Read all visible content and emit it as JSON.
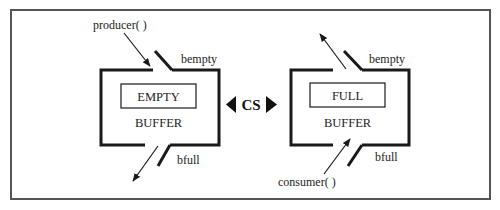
{
  "diagram": {
    "left_buffer": {
      "state_label": "EMPTY",
      "name_label": "BUFFER",
      "top_gate_label": "bempty",
      "bottom_gate_label": "bfull",
      "actor_label": "producer( )",
      "actor_position": "top-left, arrow entering through top gate",
      "exit_arrow": "down-left through bottom gate"
    },
    "center": {
      "label": "CS",
      "left_arrow": "left-pointing triangle",
      "right_arrow": "right-pointing triangle"
    },
    "right_buffer": {
      "state_label": "FULL",
      "name_label": "BUFFER",
      "top_gate_label": "bempty",
      "bottom_gate_label": "bfull",
      "actor_label": "consumer( )",
      "actor_position": "bottom-left, arrow entering through bottom gate",
      "exit_arrow": "up-left through top gate"
    },
    "colors": {
      "frame": "#555555",
      "lines": "#1a1a1a",
      "text": "#222222",
      "background": "#ffffff"
    }
  }
}
